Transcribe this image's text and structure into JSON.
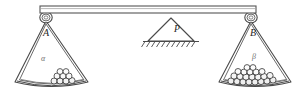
{
  "diagram": {
    "type": "mechanical-balance",
    "background_color": "#ffffff",
    "stroke_color": "#4a4a4a",
    "fill_color": "#ffffff"
  },
  "beam": {
    "name": "balance-beam",
    "x1": 40,
    "x2": 256,
    "y": 9,
    "thickness": 7,
    "stroke": "#555555"
  },
  "fulcrum": {
    "label": "P",
    "label_x": 176,
    "label_y": 30,
    "apex_x": 171,
    "apex_y": 18,
    "base_left_x": 148,
    "base_right_x": 194,
    "base_y": 41,
    "hatch_count": 11,
    "ground_left_x": 143,
    "ground_right_x": 199,
    "ground_y": 41,
    "stroke": "#4a4a4a"
  },
  "pans": [
    {
      "id": "left-pan",
      "label": "A",
      "greek_label": "α",
      "pivot_x": 46,
      "pivot_y": 17,
      "label_x": 46,
      "label_y": 34,
      "greek_x": 43,
      "greek_y": 59,
      "ball_count": 9,
      "ball_rows": 2,
      "fill_level": "low",
      "rim_left_x": 15,
      "rim_right_x": 88,
      "rim_y": 82,
      "rim_dip": 9
    },
    {
      "id": "right-pan",
      "label": "B",
      "greek_label": "β",
      "pivot_x": 251,
      "pivot_y": 17,
      "label_x": 253,
      "label_y": 34,
      "greek_x": 254,
      "greek_y": 57,
      "ball_count": 22,
      "ball_rows": 3,
      "fill_level": "high",
      "rim_left_x": 219,
      "rim_right_x": 291,
      "rim_y": 82,
      "rim_dip": 9
    }
  ],
  "balls": {
    "stroke": "#3a3a3a",
    "fill": "#f2f2f2",
    "radius": 3.1,
    "left_pile": [
      {
        "cx": 54,
        "cy": 81,
        "r": 3.0
      },
      {
        "cx": 60,
        "cy": 81,
        "r": 3.0
      },
      {
        "cx": 66,
        "cy": 81,
        "r": 3.0
      },
      {
        "cx": 72,
        "cy": 81,
        "r": 3.0
      },
      {
        "cx": 57,
        "cy": 76,
        "r": 3.0
      },
      {
        "cx": 63,
        "cy": 76,
        "r": 3.0
      },
      {
        "cx": 69,
        "cy": 76,
        "r": 3.0
      },
      {
        "cx": 60,
        "cy": 71.5,
        "r": 2.9
      },
      {
        "cx": 66,
        "cy": 71.5,
        "r": 2.9
      }
    ],
    "right_pile": [
      {
        "cx": 231,
        "cy": 81,
        "r": 3.1
      },
      {
        "cx": 237,
        "cy": 81.5,
        "r": 3.1
      },
      {
        "cx": 243,
        "cy": 82,
        "r": 3.1
      },
      {
        "cx": 249,
        "cy": 82,
        "r": 3.1
      },
      {
        "cx": 255,
        "cy": 82,
        "r": 3.1
      },
      {
        "cx": 261,
        "cy": 81.5,
        "r": 3.1
      },
      {
        "cx": 267,
        "cy": 81,
        "r": 3.1
      },
      {
        "cx": 273,
        "cy": 80,
        "r": 3.1
      },
      {
        "cx": 234,
        "cy": 76,
        "r": 3.1
      },
      {
        "cx": 240,
        "cy": 76.5,
        "r": 3.1
      },
      {
        "cx": 246,
        "cy": 77,
        "r": 3.1
      },
      {
        "cx": 252,
        "cy": 77,
        "r": 3.1
      },
      {
        "cx": 258,
        "cy": 77,
        "r": 3.1
      },
      {
        "cx": 264,
        "cy": 76.5,
        "r": 3.1
      },
      {
        "cx": 270,
        "cy": 75.5,
        "r": 3.1
      },
      {
        "cx": 238,
        "cy": 71.5,
        "r": 3.0
      },
      {
        "cx": 244,
        "cy": 72,
        "r": 3.0
      },
      {
        "cx": 250,
        "cy": 72,
        "r": 3.0
      },
      {
        "cx": 256,
        "cy": 72,
        "r": 3.0
      },
      {
        "cx": 262,
        "cy": 71.5,
        "r": 3.0
      },
      {
        "cx": 247,
        "cy": 67.5,
        "r": 2.9
      },
      {
        "cx": 253,
        "cy": 67.5,
        "r": 2.9
      }
    ]
  }
}
